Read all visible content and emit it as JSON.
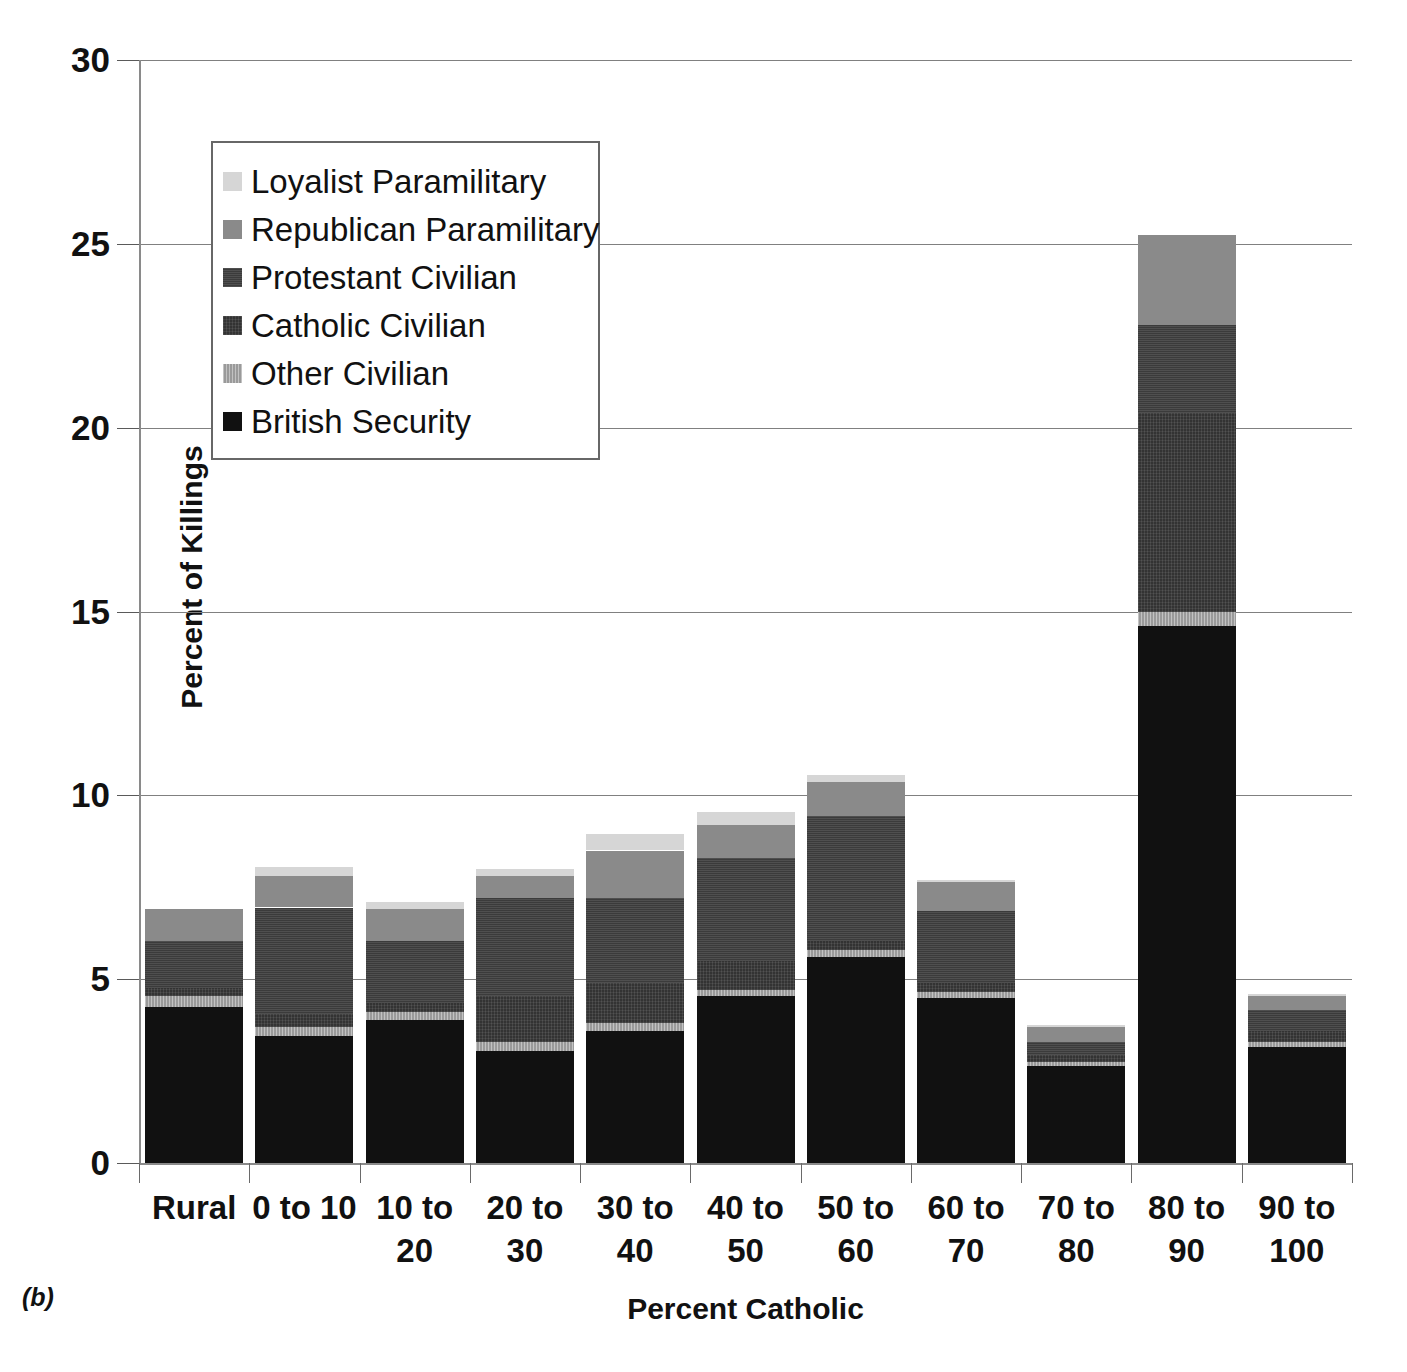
{
  "caption": "(b)",
  "chart_data": {
    "type": "bar",
    "title": "",
    "subtitle": "",
    "xlabel": "Percent Catholic",
    "ylabel": "Percent of Killings",
    "ylim": [
      0,
      30
    ],
    "yticks": [
      0,
      5,
      10,
      15,
      20,
      25,
      30
    ],
    "grid": true,
    "stacked": true,
    "legend_position": "upper-left-inside",
    "categories": [
      "Rural",
      "0 to 10",
      "10 to 20",
      "20 to 30",
      "30 to 40",
      "40 to 50",
      "50 to 60",
      "60 to 70",
      "70 to 80",
      "80 to 90",
      "90 to 100"
    ],
    "category_label_lines": [
      [
        "Rural"
      ],
      [
        "0 to 10"
      ],
      [
        "10 to",
        "20"
      ],
      [
        "20 to",
        "30"
      ],
      [
        "30 to",
        "40"
      ],
      [
        "40 to",
        "50"
      ],
      [
        "50 to",
        "60"
      ],
      [
        "60 to",
        "70"
      ],
      [
        "70 to",
        "80"
      ],
      [
        "80 to",
        "90"
      ],
      [
        "90 to",
        "100"
      ]
    ],
    "series": [
      {
        "name": "British Security",
        "color": "#111111",
        "values": [
          4.25,
          3.45,
          3.9,
          3.05,
          3.6,
          4.55,
          5.6,
          4.5,
          2.65,
          14.6,
          3.15
        ]
      },
      {
        "name": "Other Civilian",
        "color": "#9a9a9a",
        "values": [
          0.3,
          0.25,
          0.2,
          0.25,
          0.2,
          0.15,
          0.2,
          0.15,
          0.1,
          0.4,
          0.15
        ]
      },
      {
        "name": "Catholic Civilian",
        "color": "#333333",
        "values": [
          0.2,
          0.35,
          0.25,
          1.25,
          1.1,
          0.8,
          0.25,
          0.25,
          0.2,
          5.4,
          0.3
        ]
      },
      {
        "name": "Protestant Civilian",
        "color": "#3b3b3b",
        "values": [
          1.3,
          2.9,
          1.7,
          2.65,
          2.3,
          2.8,
          3.4,
          1.95,
          0.35,
          2.4,
          0.55
        ]
      },
      {
        "name": "Republican Paramilitary",
        "color": "#8a8a8a",
        "values": [
          0.85,
          0.85,
          0.85,
          0.6,
          1.3,
          0.9,
          0.9,
          0.8,
          0.4,
          2.45,
          0.4
        ]
      },
      {
        "name": "Loyalist Paramilitary",
        "color": "#d6d6d6",
        "values": [
          0.0,
          0.25,
          0.2,
          0.2,
          0.45,
          0.35,
          0.2,
          0.05,
          0.05,
          0.0,
          0.05
        ]
      }
    ],
    "totals": [
      6.9,
      8.05,
      7.1,
      8.0,
      8.95,
      9.55,
      10.55,
      7.7,
      3.75,
      25.25,
      4.6
    ]
  },
  "legend": {
    "items": [
      {
        "label": "Loyalist Paramilitary",
        "swatch": "loyalist-swatch"
      },
      {
        "label": "Republican Paramilitary",
        "swatch": "republican-swatch"
      },
      {
        "label": "Protestant Civilian",
        "swatch": "protestant-swatch"
      },
      {
        "label": "Catholic Civilian",
        "swatch": "catholic-swatch"
      },
      {
        "label": "Other Civilian",
        "swatch": "other-swatch"
      },
      {
        "label": "British Security",
        "swatch": "british-swatch"
      }
    ]
  }
}
